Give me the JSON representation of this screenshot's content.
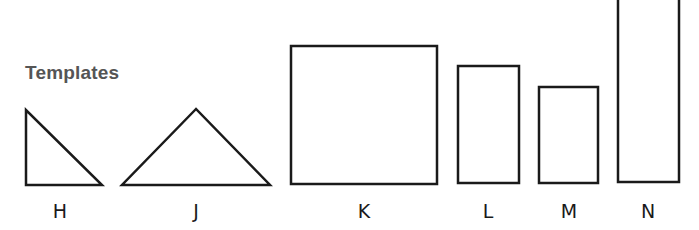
{
  "title": "Templates",
  "stroke_color": "#1a1a1a",
  "shapes": [
    {
      "label": "H",
      "type": "right-triangle"
    },
    {
      "label": "J",
      "type": "triangle"
    },
    {
      "label": "K",
      "type": "rectangle"
    },
    {
      "label": "L",
      "type": "rectangle"
    },
    {
      "label": "M",
      "type": "rectangle"
    },
    {
      "label": "N",
      "type": "rectangle"
    }
  ]
}
